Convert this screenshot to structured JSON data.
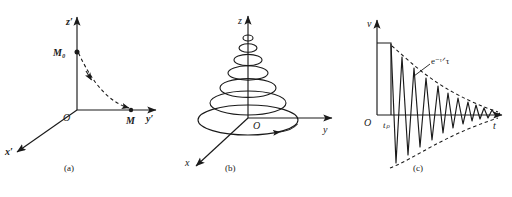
{
  "figure": {
    "panels": [
      {
        "id": "a",
        "sublabel": "(a)",
        "description": "magnetization-relaxation-in-rotating-frame",
        "axes": {
          "vertical": "z′",
          "horizontal": "y′",
          "depth": "x′",
          "origin": "O"
        },
        "points": [
          {
            "name": "M0",
            "label": "M₀",
            "position": "on-z-prime-axis"
          },
          {
            "name": "M",
            "label": "M",
            "position": "on-y-prime-axis"
          }
        ],
        "trajectory": {
          "style": "dashed",
          "from": "M₀",
          "to": "M",
          "arrow": true
        }
      },
      {
        "id": "b",
        "sublabel": "(b)",
        "description": "spiral-precession-of-magnetization-vector",
        "axes": {
          "vertical": "z",
          "horizontal": "y",
          "depth": "x",
          "origin": "O"
        },
        "spiral": {
          "style": "solid",
          "loops": 7,
          "direction": "counterclockwise",
          "shape": "conical-helix-narrowing-upward",
          "arrow": true
        }
      },
      {
        "id": "c",
        "sublabel": "(c)",
        "description": "free-induction-decay-signal",
        "axes": {
          "vertical": "v",
          "horizontal": "t",
          "origin": "O"
        },
        "tick_labels": [
          {
            "name": "pulse-duration",
            "label": "tₚ",
            "axis": "t"
          }
        ],
        "pulse": {
          "shape": "rectangular-block",
          "from": "O",
          "to": "tₚ"
        },
        "envelope": {
          "style": "dashed",
          "label": "e⁻ᵗᐟτ",
          "symmetric": true
        },
        "signal": {
          "style": "solid",
          "type": "damped-oscillation",
          "cycles": 11
        }
      }
    ]
  },
  "colors": {
    "ink": "#1a1a1a",
    "background": "#ffffff"
  }
}
